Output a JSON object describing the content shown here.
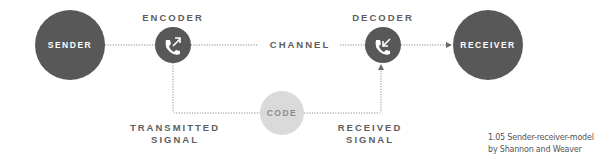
{
  "diagram": {
    "nodes": {
      "sender": {
        "label": "SENDER",
        "color": "#585858"
      },
      "encoder": {
        "label": "ENCODER",
        "icon": "outgoing-call-icon",
        "color": "#585858"
      },
      "decoder": {
        "label": "DECODER",
        "icon": "incoming-call-icon",
        "color": "#585858"
      },
      "receiver": {
        "label": "RECEIVER",
        "color": "#585858"
      },
      "code": {
        "label": "CODE",
        "color": "#d9d9d9"
      }
    },
    "edges": {
      "channel": "CHANNEL",
      "transmitted_line1": "TRANSMITTED",
      "transmitted_line2": "SIGNAL",
      "received_line1": "RECEIVED",
      "received_line2": "SIGNAL"
    },
    "caption": {
      "line1": "1.05 Sender-receiver-model",
      "line2": "by Shannon and Weaver"
    }
  }
}
